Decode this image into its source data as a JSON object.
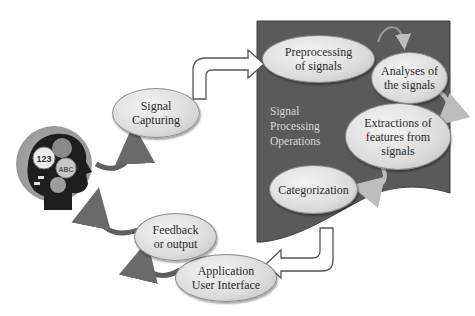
{
  "diagram": {
    "type": "flow-cycle",
    "panel": {
      "label": "Signal\nProcessing\nOperations",
      "color": "#595959"
    },
    "nodes": {
      "signal_capturing": "Signal\nCapturing",
      "preprocessing": "Preprocessing\nof signals",
      "analyses": "Analyses of\nthe signals",
      "extractions": "Extractions of\nfeatures from\nsignals",
      "categorization": "Categorization",
      "application_ui": "Application\nUser Interface",
      "feedback": "Feedback\nor output"
    },
    "head_icon": {
      "symbols": [
        "123",
        "ABC"
      ]
    },
    "colors": {
      "node_fill": "#dcdcdc",
      "arrow_dark": "#5f5f5f",
      "block_arrow_fill": "#ffffff",
      "block_arrow_stroke": "#555555",
      "background": "#ffffff"
    },
    "edges": [
      [
        "head",
        "signal_capturing"
      ],
      [
        "signal_capturing",
        "preprocessing"
      ],
      [
        "preprocessing",
        "analyses"
      ],
      [
        "analyses",
        "extractions"
      ],
      [
        "extractions",
        "categorization"
      ],
      [
        "categorization",
        "application_ui"
      ],
      [
        "application_ui",
        "feedback"
      ],
      [
        "feedback",
        "head"
      ]
    ]
  }
}
